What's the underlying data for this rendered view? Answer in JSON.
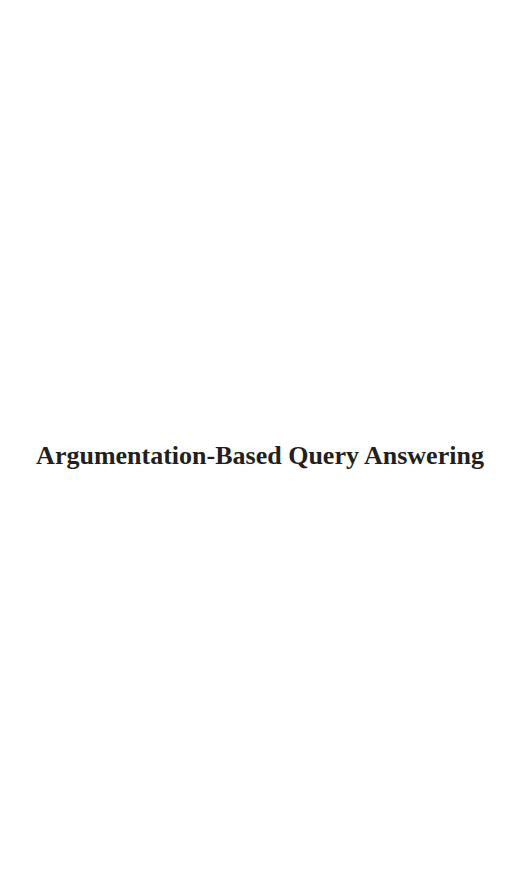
{
  "page": {
    "title": "Argumentation-Based Query Answering",
    "colors": {
      "background": "#ffffff",
      "text": "#231f20"
    }
  }
}
